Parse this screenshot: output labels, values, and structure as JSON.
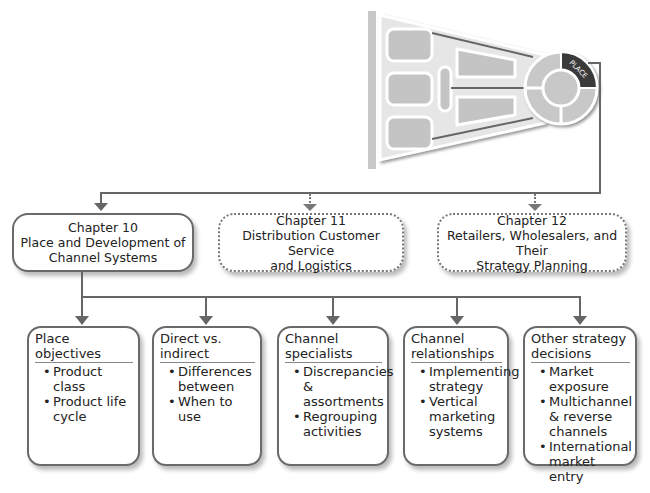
{
  "graphic": {
    "badge_label": "PLACE"
  },
  "chapters": [
    {
      "number": "Chapter 10",
      "title_line1": "Place and Development of",
      "title_line2": "Channel Systems",
      "style": "solid"
    },
    {
      "number": "Chapter 11",
      "title_line1": "Distribution Customer Service",
      "title_line2": "and Logistics",
      "style": "dotted"
    },
    {
      "number": "Chapter 12",
      "title_line1": "Retailers, Wholesalers, and Their",
      "title_line2": "Strategy Planning",
      "style": "dotted"
    }
  ],
  "topics": [
    {
      "title_line1": "Place",
      "title_line2": "objectives",
      "bullets": [
        "Product class",
        "Product life cycle"
      ]
    },
    {
      "title_line1": "Direct vs.",
      "title_line2": "indirect",
      "bullets": [
        "Differences between",
        "When to use"
      ]
    },
    {
      "title_line1": "Channel",
      "title_line2": "specialists",
      "bullets": [
        "Discrepancies & assortments",
        "Regrouping activities"
      ]
    },
    {
      "title_line1": "Channel",
      "title_line2": "relationships",
      "bullets": [
        "Implementing strategy",
        "Vertical marketing systems"
      ]
    },
    {
      "title_line1": "Other strategy",
      "title_line2": "decisions",
      "bullets": [
        "Market exposure",
        "Multichannel & reverse channels",
        "International market entry"
      ]
    }
  ]
}
